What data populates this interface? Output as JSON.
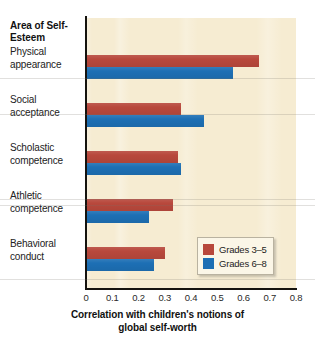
{
  "chart_data": {
    "type": "bar",
    "orientation": "horizontal",
    "title": "",
    "row_header": "Area of\nSelf-Esteem",
    "row_header_line1": "Area of",
    "row_header_line2": "Self-Esteem",
    "categories": [
      "Physical appearance",
      "Social acceptance",
      "Scholastic competence",
      "Athletic competence",
      "Behavioral conduct"
    ],
    "category_lines": [
      [
        "Physical",
        "appearance"
      ],
      [
        "Social",
        "acceptance"
      ],
      [
        "Scholastic",
        "competence"
      ],
      [
        "Athletic",
        "competence"
      ],
      [
        "Behavioral",
        "conduct"
      ]
    ],
    "series": [
      {
        "name": "Grades 3–5",
        "color": "#b8483c",
        "values": [
          0.66,
          0.36,
          0.35,
          0.33,
          0.3
        ]
      },
      {
        "name": "Grades 6–8",
        "color": "#1d6fb4",
        "values": [
          0.56,
          0.45,
          0.36,
          0.24,
          0.26
        ]
      }
    ],
    "xlabel_line1": "Correlation with children's notions of",
    "xlabel_line2": "global self-worth",
    "ylabel": "Area of Self-Esteem",
    "xlim": [
      0,
      0.8
    ],
    "xticks": [
      "0",
      "0.1",
      "0.2",
      "0.3",
      "0.4",
      "0.5",
      "0.6",
      "0.7",
      "0.8"
    ],
    "xtick_values": [
      0,
      0.1,
      0.2,
      0.3,
      0.4,
      0.5,
      0.6,
      0.7,
      0.8
    ],
    "grid": false,
    "legend_position": "bottom-right",
    "plot_background": "#f6ecd2"
  },
  "legend": {
    "items": [
      {
        "label": "Grades 3–5",
        "color": "#b8483c"
      },
      {
        "label": "Grades 6–8",
        "color": "#1d6fb4"
      }
    ]
  }
}
